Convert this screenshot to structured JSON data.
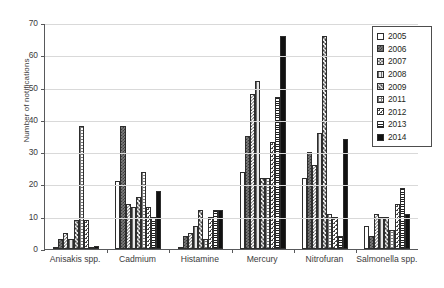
{
  "chart_data": {
    "type": "bar",
    "title": "",
    "xlabel": "",
    "ylabel": "Number of notifications",
    "ylim": [
      0,
      70
    ],
    "yticks": [
      0,
      10,
      20,
      30,
      40,
      50,
      60,
      70
    ],
    "grid": true,
    "legend_position": "top-right",
    "categories": [
      "Anisakis spp.",
      "Cadmium",
      "Histamine",
      "Mercury",
      "Nitrofuran",
      "Salmonella spp."
    ],
    "series": [
      {
        "name": "2005",
        "pattern": "open-white",
        "values": [
          0,
          21,
          0,
          24,
          22,
          7
        ]
      },
      {
        "name": "2006",
        "pattern": "dark-checker",
        "values": [
          3,
          38,
          4,
          35,
          30,
          4
        ]
      },
      {
        "name": "2007",
        "pattern": "light-checker",
        "values": [
          5,
          14,
          5,
          48,
          26,
          11
        ]
      },
      {
        "name": "2008",
        "pattern": "vertical-lines",
        "values": [
          3,
          13,
          7,
          52,
          36,
          10
        ]
      },
      {
        "name": "2009",
        "pattern": "cross-diagonal",
        "values": [
          9,
          16,
          12,
          22,
          66,
          10
        ]
      },
      {
        "name": "2011",
        "pattern": "grid-squares",
        "values": [
          38,
          24,
          3,
          22,
          11,
          6
        ]
      },
      {
        "name": "2012",
        "pattern": "dotted",
        "values": [
          9,
          13,
          10,
          33,
          10,
          14
        ]
      },
      {
        "name": "2013",
        "pattern": "horizontal-lines",
        "values": [
          0,
          10,
          12,
          47,
          4,
          19
        ]
      },
      {
        "name": "2014",
        "pattern": "solid-black",
        "values": [
          1,
          18,
          12,
          66,
          34,
          11
        ]
      }
    ]
  },
  "legend": {
    "items": [
      {
        "label": "2005"
      },
      {
        "label": "2006"
      },
      {
        "label": "2007"
      },
      {
        "label": "2008"
      },
      {
        "label": "2009"
      },
      {
        "label": "2011"
      },
      {
        "label": "2012"
      },
      {
        "label": "2013"
      },
      {
        "label": "2014"
      }
    ]
  },
  "colors": {
    "axis": "#58595b",
    "grid": "#d9d9d9",
    "text": "#231f20",
    "bar_outline": "#2d2d2d",
    "solid_fill": "#111111"
  }
}
